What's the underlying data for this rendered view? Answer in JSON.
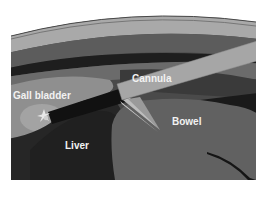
{
  "figure": {
    "type": "laparoscopy illustration",
    "colors": {
      "background": "#ffffff",
      "skin_outer_line": "#4a4a4a",
      "skin_layer": "#a9a9a9",
      "fat_layer": "#5c5c5c",
      "muscle_dark_band": "#1e1e1e",
      "deep_layer": "#6b6b6b",
      "peritoneal_cavity": "#4a4a4a",
      "gall_bladder": "#9a9a9a",
      "liver": "#262626",
      "bowel": "#616161",
      "cannula": "#a6a6a6",
      "instrument_shaft": "#111111",
      "label_text": "#f2f2f2"
    }
  },
  "labels": {
    "cannula": "Cannula",
    "gall_bladder": "Gall bladder",
    "liver": "Liver",
    "bowel": "Bowel"
  }
}
